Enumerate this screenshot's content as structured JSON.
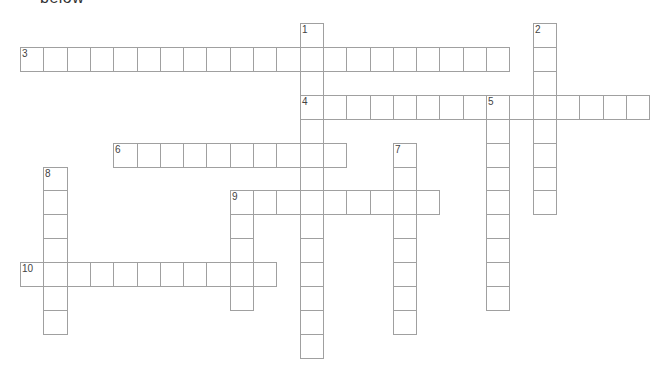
{
  "heading_fragment": "below",
  "grid": {
    "origin_x": 20,
    "origin_y": 22.7,
    "cell_w": 23.3,
    "cell_h": 23.97,
    "line_color": "#a0a0a0",
    "number_color": "#444444"
  },
  "words": [
    {
      "number": "1",
      "direction": "down",
      "col": 12,
      "row": 0,
      "length": 14
    },
    {
      "number": "2",
      "direction": "down",
      "col": 22,
      "row": 0,
      "length": 8
    },
    {
      "number": "3",
      "direction": "across",
      "col": 0,
      "row": 1,
      "length": 21
    },
    {
      "number": "4",
      "direction": "across",
      "col": 12,
      "row": 3,
      "length": 15
    },
    {
      "number": "5",
      "direction": "down",
      "col": 20,
      "row": 3,
      "length": 9
    },
    {
      "number": "6",
      "direction": "across",
      "col": 4,
      "row": 5,
      "length": 10
    },
    {
      "number": "7",
      "direction": "down",
      "col": 16,
      "row": 5,
      "length": 8
    },
    {
      "number": "8",
      "direction": "down",
      "col": 1,
      "row": 6,
      "length": 7
    },
    {
      "number": "9",
      "direction": "across",
      "col": 9,
      "row": 7,
      "length": 9
    },
    {
      "number": "9",
      "direction": "down",
      "col": 9,
      "row": 7,
      "length": 5
    },
    {
      "number": "10",
      "direction": "across",
      "col": 0,
      "row": 10,
      "length": 11
    }
  ]
}
